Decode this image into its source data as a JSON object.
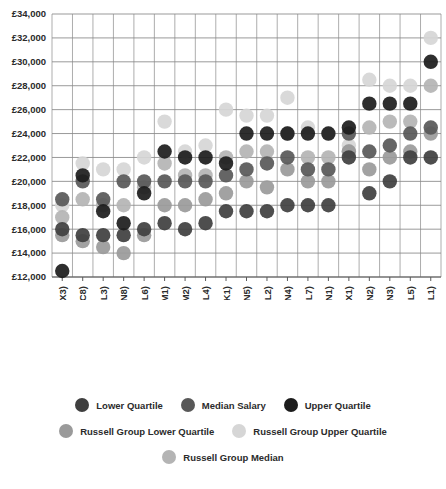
{
  "chart_data": {
    "type": "scatter",
    "title": "",
    "subtitle": "",
    "xlabel": "",
    "ylabel": "",
    "ylim": [
      12000,
      34000
    ],
    "ytick_step": 2000,
    "grid": true,
    "legend_position": "bottom",
    "ytick_labels": [
      "£34,000",
      "£32,000",
      "£30,000",
      "£28,000",
      "£26,000",
      "£24,000",
      "£22,000",
      "£20,000",
      "£18,000",
      "£16,000",
      "£14,000",
      "£12,000"
    ],
    "ytick_values": [
      34000,
      32000,
      30000,
      28000,
      26000,
      24000,
      22000,
      20000,
      18000,
      16000,
      14000,
      12000
    ],
    "categories": [
      "Ac. Stud. in Ed. (X3)",
      "Psychology (C8)",
      "Sociology (L3)",
      "Hospitality, ... (N8)",
      "Anthropology (L6)",
      "Law by Area (M1)",
      "Law by Topic (M2)",
      "Social Policy (L4)",
      "Architecture (K1)",
      "Marketing (N5)",
      "Politics (L2)",
      "Accounting (N4)",
      "H&S Geography (L7)",
      "Business Stud. (N1)",
      "Train. Teachers (X1)",
      "Management ... (N2)",
      "Finance (N3)",
      "Social Work (L5)",
      "Economics (L1)"
    ],
    "series": [
      {
        "name": "Lower Quartile",
        "color": "#3f3f3f",
        "values": [
          16000,
          15500,
          15500,
          15500,
          16000,
          16500,
          16000,
          16500,
          17500,
          17500,
          17500,
          18000,
          18000,
          18000,
          22000,
          19000,
          20000,
          22000,
          22000
        ]
      },
      {
        "name": "Median Salary",
        "color": "#585858",
        "values": [
          18500,
          20000,
          18500,
          20000,
          20000,
          20000,
          20000,
          20000,
          20500,
          21000,
          21500,
          22000,
          21000,
          21000,
          24000,
          22500,
          23000,
          24000,
          24500
        ]
      },
      {
        "name": "Upper Quartile",
        "color": "#1c1c1c",
        "values": [
          12500,
          20500,
          17500,
          16500,
          19000,
          22500,
          22000,
          22000,
          21500,
          24000,
          24000,
          24000,
          24000,
          24000,
          24500,
          26500,
          26500,
          26500,
          30000
        ]
      },
      {
        "name": "Russell Group Lower Quartile",
        "color": "#9a9a9a",
        "values": [
          15500,
          15000,
          14500,
          14000,
          15500,
          18000,
          18000,
          18500,
          19000,
          20000,
          19500,
          21000,
          20000,
          20000,
          22500,
          21000,
          22000,
          22500,
          24000
        ]
      },
      {
        "name": "Russell Group Upper Quartile",
        "color": "#d6d6d6",
        "values": [
          18000,
          21500,
          21000,
          21000,
          22000,
          25000,
          22500,
          23000,
          26000,
          25500,
          25500,
          27000,
          24500,
          24000,
          23000,
          28500,
          28000,
          28000,
          32000
        ]
      },
      {
        "name": "Russell Group Median",
        "color": "#b4b4b4",
        "values": [
          17000,
          18500,
          18000,
          18000,
          19500,
          21500,
          20500,
          20500,
          22000,
          22500,
          22500,
          24000,
          22000,
          22000,
          22500,
          24500,
          25000,
          25000,
          28000
        ]
      }
    ]
  },
  "legend": {
    "rows": [
      [
        {
          "label": "Lower Quartile",
          "color": "#3f3f3f"
        },
        {
          "label": "Median Salary",
          "color": "#585858"
        },
        {
          "label": "Upper Quartile",
          "color": "#1c1c1c"
        }
      ],
      [
        {
          "label": "Russell Group Lower Quartile",
          "color": "#9a9a9a"
        },
        {
          "label": "Russell Group Upper Quartile",
          "color": "#d6d6d6"
        }
      ],
      [
        {
          "label": "Russell Group Median",
          "color": "#b4b4b4"
        }
      ]
    ]
  }
}
